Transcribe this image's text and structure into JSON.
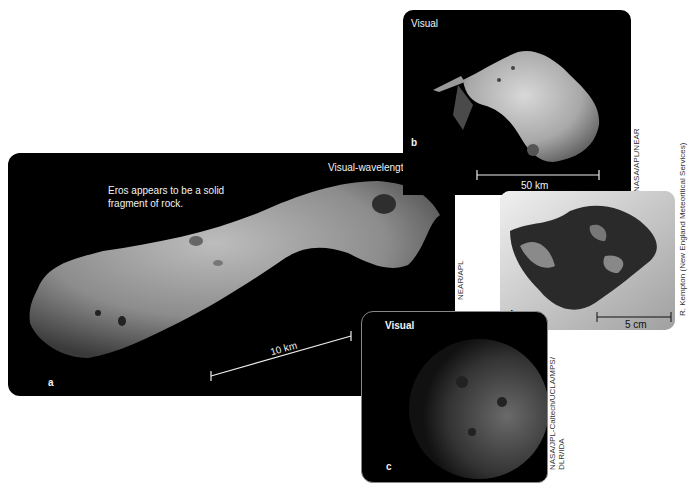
{
  "figure": {
    "panels": [
      {
        "id": "a",
        "letter": "a",
        "title": "Visual-wavelength image",
        "caption": "Eros appears to be a solid fragment of rock.",
        "scale_bar": "10 km",
        "subject": "asteroid Eros",
        "credit": "NEAR/APL"
      },
      {
        "id": "b",
        "letter": "b",
        "title": "Visual",
        "scale_bar": "50 km",
        "subject": "asteroid Mathilde",
        "credit": "NASA/APL/NEAR"
      },
      {
        "id": "c",
        "letter": "c",
        "title": "Visual",
        "subject": "asteroid Vesta",
        "credit_line1": "NASA/JPL-Caltech/UCLA/MPS/",
        "credit_line2": "DLR/IDA"
      },
      {
        "id": "d",
        "letter": "d",
        "scale_bar": "5 cm",
        "subject": "meteorite",
        "credit": "R. Kempton (New England Meteoritical Services)"
      }
    ],
    "colors": {
      "panel_background": "#000000",
      "meteorite_background": "#d9d9d9",
      "label_text": "#f2f2f2",
      "page_background": "#ffffff"
    }
  }
}
